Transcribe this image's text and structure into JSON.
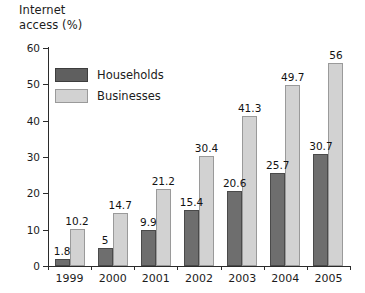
{
  "chart_data": {
    "type": "bar",
    "title": "Internet\naccess (%)",
    "title_line1": "Internet",
    "title_line2": "access (%)",
    "xlabel": "",
    "ylabel": "Internet access (%)",
    "ylim": [
      0,
      60
    ],
    "yticks": [
      0,
      10,
      20,
      30,
      40,
      50,
      60
    ],
    "ytick_labels": [
      "0",
      "10",
      "20",
      "30",
      "40",
      "50",
      "60"
    ],
    "grid": false,
    "legend_position": "upper-left-inside",
    "categories": [
      "1999",
      "2000",
      "2001",
      "2002",
      "2003",
      "2004",
      "2005"
    ],
    "series": [
      {
        "name": "Households",
        "color": "#6e6e6e",
        "values": [
          1.8,
          5,
          9.9,
          15.4,
          20.6,
          25.7,
          30.7
        ],
        "labels": [
          "1.8",
          "5",
          "9.9",
          "15.4",
          "20.6",
          "25.7",
          "30.7"
        ]
      },
      {
        "name": "Businesses",
        "color": "#d2d2d2",
        "values": [
          10.2,
          14.7,
          21.2,
          30.4,
          41.3,
          49.7,
          56
        ],
        "labels": [
          "10.2",
          "14.7",
          "21.2",
          "30.4",
          "41.3",
          "49.7",
          "56"
        ]
      }
    ]
  },
  "legend": {
    "items": [
      {
        "label": "Households",
        "swatch": "households-swatch"
      },
      {
        "label": "Businesses",
        "swatch": "businesses-swatch"
      }
    ]
  }
}
